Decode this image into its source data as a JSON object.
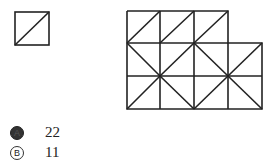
{
  "figure": {
    "single_piece": "square with diagonal",
    "composite": "3x3 grid with extra column on two lower rows, tiled triangles"
  },
  "options": [
    {
      "letter": "A",
      "value": "22",
      "selected": true
    },
    {
      "letter": "B",
      "value": "11",
      "selected": false
    }
  ]
}
